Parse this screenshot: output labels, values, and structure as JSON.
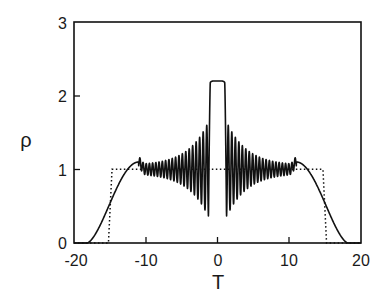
{
  "chart_data": {
    "type": "line",
    "title": "",
    "xlabel": "T",
    "ylabel": "ρ",
    "xlim": [
      -20,
      20
    ],
    "ylim": [
      0,
      3
    ],
    "grid": false,
    "legend": null,
    "x_ticks": [
      -20,
      -10,
      0,
      10,
      20
    ],
    "x_tick_labels": [
      "-20",
      "-10",
      "0",
      "10",
      "20"
    ],
    "y_ticks": [
      0,
      1,
      2,
      3
    ],
    "y_tick_labels": [
      "0",
      "1",
      "2",
      "3"
    ],
    "series": [
      {
        "name": "dotted step (initial profile)",
        "style": "dotted",
        "x": [
          -20,
          -15.2,
          -14.7,
          14.7,
          15.2,
          20
        ],
        "y": [
          0,
          0,
          1.0,
          1.0,
          0,
          0
        ]
      },
      {
        "name": "solid oscillating profile",
        "style": "solid",
        "description": "Smooth rise from ~0 at T≈-18 to a bump ~1.1 at T≈-11, small oscillations about 1 that grow toward the center (min ≈0.42 at T≈±1.4), flat central plateau ρ≈2.2 for |T|<1; symmetric about T=0",
        "key_points": {
          "x": [
            -20,
            -18,
            -16,
            -14,
            -12,
            -11,
            -8,
            -5,
            -3,
            -2,
            -1.4,
            -1,
            0,
            1,
            1.4,
            2,
            3,
            5,
            8,
            11,
            12,
            14,
            16,
            18,
            20
          ],
          "y": [
            0,
            0.02,
            0.2,
            0.6,
            1.0,
            1.1,
            1.02,
            1.0,
            1.0,
            1.0,
            0.42,
            2.18,
            2.2,
            2.18,
            0.42,
            1.0,
            1.0,
            1.0,
            1.02,
            1.1,
            1.0,
            0.6,
            0.2,
            0.02,
            0
          ]
        },
        "oscillation_envelope": {
          "center": 1.0,
          "max_amplitude": 0.6,
          "inner_edge": 1.4,
          "decay_length": 2.8,
          "min_period": 0.55
        },
        "plateau": {
          "half_width": 1.0,
          "value": 2.2
        },
        "edge_bump": {
          "position": 11,
          "value": 1.1
        }
      }
    ]
  },
  "axes": {
    "x_label": "T",
    "y_label": "ρ",
    "x_tick_labels": [
      "-20",
      "-10",
      "0",
      "10",
      "20"
    ],
    "y_tick_labels": [
      "0",
      "1",
      "2",
      "3"
    ]
  }
}
